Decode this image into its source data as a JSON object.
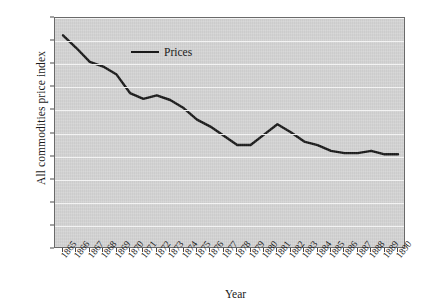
{
  "chart_data": {
    "type": "line",
    "title": "",
    "xlabel": "Year",
    "ylabel": "All commodities price index",
    "x": [
      1865,
      1866,
      1867,
      1868,
      1869,
      1870,
      1871,
      1872,
      1873,
      1874,
      1875,
      1876,
      1877,
      1878,
      1879,
      1880,
      1881,
      1882,
      1883,
      1884,
      1885,
      1886,
      1887,
      1888,
      1889,
      1890
    ],
    "categories": [
      "1865",
      "1866",
      "1867",
      "1868",
      "1869",
      "1870",
      "1871",
      "1872",
      "1873",
      "1874",
      "1875",
      "1876",
      "1877",
      "1878",
      "1879",
      "1880",
      "1881",
      "1882",
      "1883",
      "1884",
      "1885",
      "1886",
      "1887",
      "1888",
      "1889",
      "1890"
    ],
    "series": [
      {
        "name": "Prices",
        "color": "#1a1a1a",
        "values": [
          185,
          174,
          162,
          158,
          151,
          135,
          130,
          133,
          129,
          122,
          112,
          106,
          98,
          90,
          90,
          99,
          108,
          101,
          93,
          90,
          85,
          83,
          83,
          85,
          82,
          82
        ]
      }
    ],
    "ylim": [
      0,
      200
    ],
    "yticks": [
      0,
      20,
      40,
      60,
      80,
      100,
      120,
      140,
      160,
      180,
      200
    ],
    "ytick_labels": [
      "0",
      "20",
      "40",
      "60",
      "80",
      "100",
      "120",
      "140",
      "160",
      "180",
      "200"
    ],
    "grid": "horizontal",
    "legend_position": "top-left",
    "legend_entries": [
      "Prices"
    ],
    "plot_background": "#d4d4d4",
    "gridline_color": "#f3f3f3"
  }
}
